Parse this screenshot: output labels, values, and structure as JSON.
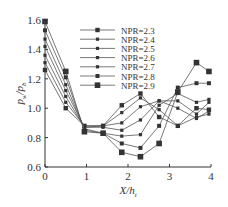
{
  "chart_data": {
    "type": "line",
    "title": "",
    "xlabel": "X/h_t",
    "ylabel": "p_w/p_b",
    "xlim": [
      0,
      4
    ],
    "ylim": [
      0.6,
      1.6
    ],
    "xticks": [
      "0",
      "1",
      "2",
      "3",
      "4"
    ],
    "yticks": [
      "0.6",
      "0.8",
      "1.0",
      "1.2",
      "1.4",
      "1.6"
    ],
    "grid": false,
    "legend_position": "upper center",
    "x": [
      0,
      0.5,
      0.95,
      1.4,
      1.85,
      2.3,
      2.75,
      3.2,
      3.65,
      3.95
    ],
    "series": [
      {
        "name": "NPR=2.3",
        "values": [
          1.26,
          1.0,
          0.88,
          0.88,
          1.02,
          1.1,
          0.94,
          0.88,
          1.0,
          0.99
        ]
      },
      {
        "name": "NPR=2.4",
        "values": [
          1.31,
          1.04,
          0.88,
          0.88,
          0.97,
          1.07,
          0.99,
          0.88,
          0.94,
          0.96
        ]
      },
      {
        "name": "NPR=2.5",
        "values": [
          1.36,
          1.08,
          0.87,
          0.88,
          0.9,
          1.01,
          1.05,
          1.0,
          0.93,
          0.98
        ]
      },
      {
        "name": "NPR=2.6",
        "values": [
          1.42,
          1.12,
          0.87,
          0.87,
          0.85,
          0.92,
          1.05,
          1.05,
          0.96,
          1.04
        ]
      },
      {
        "name": "NPR=2.7",
        "values": [
          1.47,
          1.16,
          0.86,
          0.83,
          0.81,
          0.82,
          1.02,
          1.1,
          1.04,
          1.06
        ]
      },
      {
        "name": "NPR=2.8",
        "values": [
          1.53,
          1.21,
          0.85,
          0.83,
          0.76,
          0.73,
          0.88,
          1.14,
          1.17,
          1.17
        ]
      },
      {
        "name": "NPR=2.9",
        "values": [
          1.59,
          1.25,
          0.84,
          0.83,
          0.7,
          0.67,
          0.76,
          1.11,
          1.31,
          1.25
        ]
      }
    ]
  },
  "legend": [
    "NPR=2.3",
    "NPR=2.4",
    "NPR=2.5",
    "NPR=2.6",
    "NPR=2.7",
    "NPR=2.8",
    "NPR=2.9"
  ]
}
